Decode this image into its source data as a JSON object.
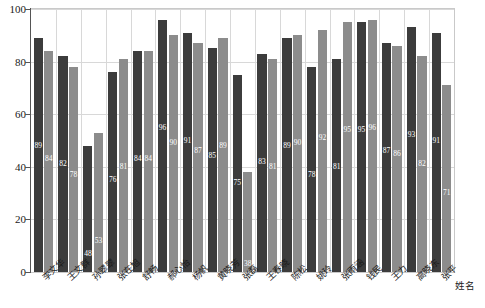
{
  "chart_data": {
    "type": "bar",
    "title": "",
    "xlabel": "姓名",
    "ylabel": "",
    "ylim": [
      0,
      100
    ],
    "ytick_values": [
      0,
      20,
      40,
      60,
      80,
      100
    ],
    "grid": true,
    "legend": "none",
    "categories": [
      "李文华",
      "王文群",
      "孙翠翠",
      "张在旭",
      "舒畅",
      "郝心怡",
      "杨帆",
      "黄晓芳",
      "张磊",
      "王春晓",
      "陈松",
      "姚玲",
      "张雨涵",
      "钱民",
      "王力",
      "高晓东",
      "张平"
    ],
    "series": [
      {
        "name": "series-1",
        "color": "#3c3c3c",
        "values": [
          89,
          82,
          48,
          76,
          84,
          96,
          91,
          85,
          75,
          83,
          89,
          78,
          81,
          95,
          87,
          93,
          91
        ]
      },
      {
        "name": "series-2",
        "color": "#8c8c8c",
        "values": [
          84,
          78,
          53,
          81,
          84,
          90,
          87,
          89,
          38,
          81,
          90,
          92,
          95,
          96,
          86,
          82,
          71
        ]
      }
    ],
    "data_labels": [
      [
        "89",
        "84"
      ],
      [
        "82",
        "78"
      ],
      [
        "48",
        "53"
      ],
      [
        "76",
        "81"
      ],
      [
        "84",
        "84"
      ],
      [
        "96",
        "90"
      ],
      [
        "91",
        "87"
      ],
      [
        "85",
        "89"
      ],
      [
        "75",
        "38"
      ],
      [
        "83",
        "81"
      ],
      [
        "89",
        "90"
      ],
      [
        "78",
        "92"
      ],
      [
        "81",
        "95"
      ],
      [
        "95",
        "96"
      ],
      [
        "87",
        "86"
      ],
      [
        "93",
        "82"
      ],
      [
        "91",
        "71"
      ]
    ]
  },
  "axis": {
    "y_labels": [
      "100",
      "80",
      "60",
      "40",
      "20",
      "0"
    ],
    "x_title": "姓名"
  }
}
